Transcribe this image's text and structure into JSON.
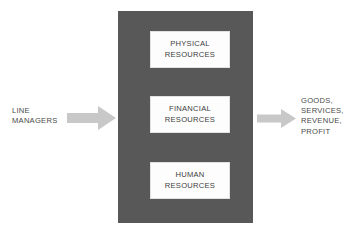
{
  "diagram": {
    "colors": {
      "background": "#ffffff",
      "organization_block": "#585858",
      "resource_box": "#fdfdfd",
      "arrow": "#c8c8c8",
      "text": "#4a4a4a"
    },
    "input": {
      "label": "LINE\nMANAGERS",
      "arrow_icon": "right-block-arrow-icon"
    },
    "organization": {
      "resources": [
        {
          "id": "physical",
          "label": "PHYSICAL\nRESOURCES"
        },
        {
          "id": "financial",
          "label": "FINANCIAL\nRESOURCES"
        },
        {
          "id": "human",
          "label": "HUMAN\nRESOURCES"
        }
      ]
    },
    "output": {
      "label": "GOODS,\nSERVICES,\nREVENUE,\nPROFIT",
      "arrow_icon": "right-block-arrow-icon"
    }
  }
}
